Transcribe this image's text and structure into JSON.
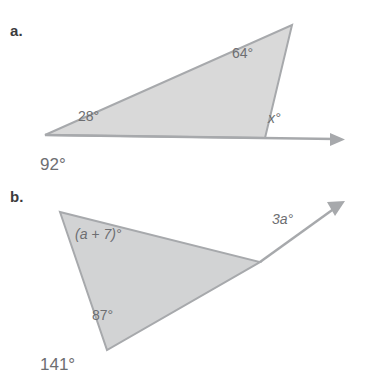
{
  "page": {
    "background": "#ffffff",
    "text_color": "#6d6e71",
    "shape_fill": "#d9d9d9",
    "shape_stroke": "#a7a9ac"
  },
  "problems": [
    {
      "label": "a.",
      "angles": [
        {
          "name": "interior-top-right",
          "text": "64°"
        },
        {
          "name": "interior-left",
          "text": "28°"
        },
        {
          "name": "exterior-x",
          "text": "x°"
        }
      ],
      "answer": "92°"
    },
    {
      "label": "b.",
      "angles": [
        {
          "name": "interior-top-left",
          "text": "(a + 7)°"
        },
        {
          "name": "exterior-3a",
          "text": "3a°"
        },
        {
          "name": "interior-bottom",
          "text": "87°"
        }
      ],
      "answer": "141°"
    }
  ]
}
